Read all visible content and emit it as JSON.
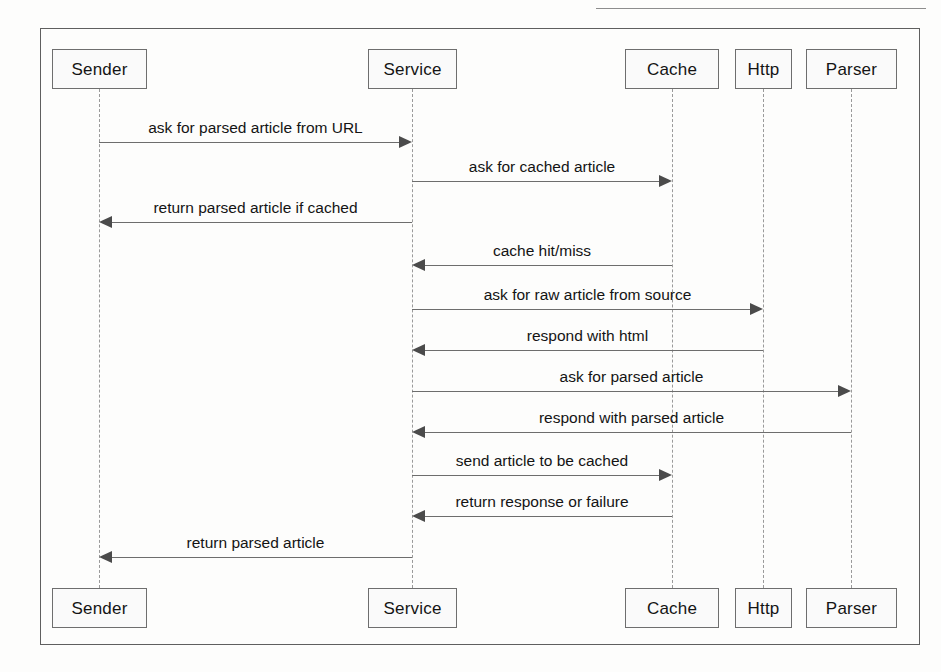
{
  "diagram": {
    "kind": "uml-sequence-diagram",
    "title": "",
    "frame": {
      "x": 40,
      "y": 28,
      "width": 880,
      "height": 617
    },
    "colors": {
      "page_background": "#fdfdfc",
      "frame_border": "#5f5f5f",
      "box_border": "#6e6e6e",
      "box_fill": "#fafafa",
      "lifeline": "#9a9a9a",
      "message_line": "#6d6d6d",
      "arrowhead": "#4b4b4b",
      "text": "#141414"
    },
    "participants": [
      {
        "name": "Sender",
        "lifeline_x": 99,
        "box_x": 52,
        "box_width": 95
      },
      {
        "name": "Service",
        "lifeline_x": 412,
        "box_x": 368,
        "box_width": 89
      },
      {
        "name": "Cache",
        "lifeline_x": 672,
        "box_x": 625,
        "box_width": 94
      },
      {
        "name": "Http",
        "lifeline_x": 763,
        "box_x": 735,
        "box_width": 57
      },
      {
        "name": "Parser",
        "lifeline_x": 851,
        "box_x": 806,
        "box_width": 91
      }
    ],
    "header_box": {
      "y": 49,
      "height": 40
    },
    "footer_box": {
      "y": 588,
      "height": 40
    },
    "messages": [
      {
        "index": 1,
        "label": "ask for parsed article from URL",
        "from": "Sender",
        "to": "Service",
        "direction": "right",
        "y": 142
      },
      {
        "index": 2,
        "label": "ask for cached article",
        "from": "Service",
        "to": "Cache",
        "direction": "right",
        "y": 181
      },
      {
        "index": 3,
        "label": "return parsed article if cached",
        "from": "Service",
        "to": "Sender",
        "direction": "left",
        "y": 222
      },
      {
        "index": 4,
        "label": "cache hit/miss",
        "from": "Cache",
        "to": "Service",
        "direction": "left",
        "y": 265
      },
      {
        "index": 5,
        "label": "ask for raw article from source",
        "from": "Service",
        "to": "Http",
        "direction": "right",
        "y": 309
      },
      {
        "index": 6,
        "label": "respond with html",
        "from": "Http",
        "to": "Service",
        "direction": "left",
        "y": 350
      },
      {
        "index": 7,
        "label": "ask for parsed article",
        "from": "Service",
        "to": "Parser",
        "direction": "right",
        "y": 391
      },
      {
        "index": 8,
        "label": "respond with parsed article",
        "from": "Parser",
        "to": "Service",
        "direction": "left",
        "y": 432
      },
      {
        "index": 9,
        "label": "send article to be cached",
        "from": "Service",
        "to": "Cache",
        "direction": "right",
        "y": 475
      },
      {
        "index": 10,
        "label": "return response or failure",
        "from": "Cache",
        "to": "Service",
        "direction": "left",
        "y": 516
      },
      {
        "index": 11,
        "label": "return parsed article",
        "from": "Service",
        "to": "Sender",
        "direction": "left",
        "y": 557
      }
    ]
  }
}
